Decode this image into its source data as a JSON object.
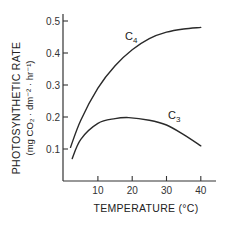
{
  "chart_data": {
    "type": "line",
    "title": "",
    "xlabel": "TEMPERATURE (°C)",
    "ylabel": "PHOTOSYNTHETIC RATE",
    "ylabel_units": "(mg CO₂ · dm⁻² · hr⁻¹)",
    "xlim": [
      0,
      45
    ],
    "ylim": [
      0,
      0.53
    ],
    "x_ticks": [
      10,
      20,
      30,
      40
    ],
    "x_tick_labels": [
      "10",
      "20",
      "30",
      "40"
    ],
    "y_ticks": [
      0.1,
      0.2,
      0.3,
      0.4,
      0.5
    ],
    "y_tick_labels": [
      "0.1",
      "0.2",
      "0.3",
      "0.4",
      "0.5"
    ],
    "grid": false,
    "legend": "inline labels on curves",
    "series": [
      {
        "name": "C4",
        "label_main": "C",
        "label_sub": "4",
        "x": [
          2,
          5,
          10,
          15,
          20,
          25,
          30,
          35,
          40
        ],
        "values": [
          0.105,
          0.19,
          0.29,
          0.36,
          0.41,
          0.445,
          0.465,
          0.475,
          0.48
        ]
      },
      {
        "name": "C3",
        "label_main": "C",
        "label_sub": "3",
        "x": [
          2.5,
          5,
          10,
          15,
          19,
          25,
          30,
          35,
          40
        ],
        "values": [
          0.07,
          0.13,
          0.18,
          0.195,
          0.198,
          0.19,
          0.175,
          0.145,
          0.11
        ]
      }
    ]
  }
}
